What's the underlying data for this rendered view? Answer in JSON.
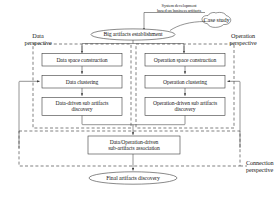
{
  "diagram": {
    "title_note": "System development\nbased on business artifacts",
    "case_study": "Case study",
    "root": "Big artifacts establishment",
    "final": "Final artifacts discovery",
    "perspectives": {
      "data": "Data\nperspective",
      "operation": "Operation\nperspective",
      "connection": "Connection\nperspective"
    },
    "data_column": [
      "Data space construction",
      "Data clustering",
      "Data-driven sub artifacts\ndiscovery"
    ],
    "operation_column": [
      "Operation space construction",
      "Operation clustering",
      "Operation-driven sub artifacts\ndiscovery"
    ],
    "association": "Data/Operation-driven\nsub-artifacts association",
    "colors": {
      "stroke": "#3a3a3a",
      "dashed": "#4a4a4a",
      "text": "#1a1a1a",
      "background": "#ffffff"
    }
  }
}
